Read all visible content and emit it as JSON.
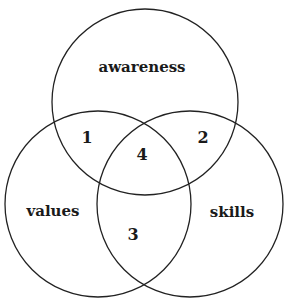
{
  "diagram": {
    "type": "venn",
    "stroke_color": "#222222",
    "background": "#ffffff",
    "sets": [
      {
        "id": "awareness",
        "label": "awareness",
        "cx": 145,
        "cy": 102,
        "r": 93
      },
      {
        "id": "values",
        "label": "values",
        "cx": 98,
        "cy": 204,
        "r": 93
      },
      {
        "id": "skills",
        "label": "skills",
        "cx": 190,
        "cy": 204,
        "r": 93
      }
    ],
    "regions": [
      {
        "id": "awareness-values",
        "label": "1"
      },
      {
        "id": "awareness-skills",
        "label": "2"
      },
      {
        "id": "values-skills",
        "label": "3"
      },
      {
        "id": "all-three",
        "label": "4"
      }
    ]
  }
}
